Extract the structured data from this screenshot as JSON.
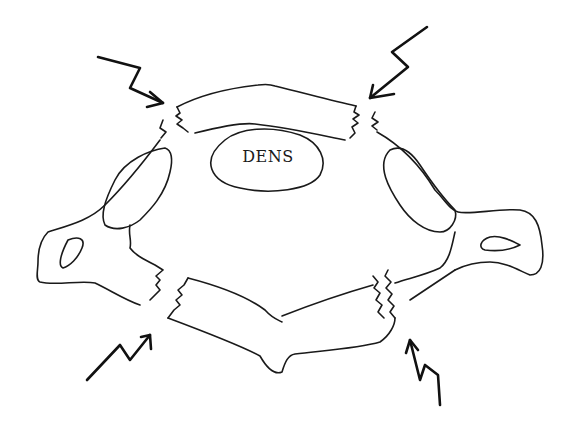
{
  "diagram": {
    "labels": {
      "dens": "DENS"
    },
    "colors": {
      "background": "#ffffff",
      "line": "#1a1a1a"
    },
    "arrows": [
      {
        "position": "top-left",
        "direction": "down-right"
      },
      {
        "position": "top-right",
        "direction": "down-left"
      },
      {
        "position": "bottom-left",
        "direction": "up-right"
      },
      {
        "position": "bottom-right",
        "direction": "up"
      }
    ],
    "fracture_sites": [
      "anterior-left",
      "anterior-right",
      "posterior-left",
      "posterior-right"
    ]
  }
}
